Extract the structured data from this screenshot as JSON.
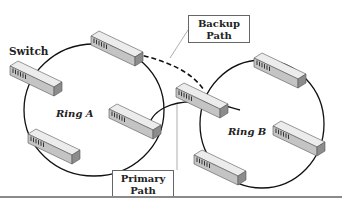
{
  "diagram": {
    "labels": {
      "switch": "Switch",
      "ring_a": "Ring A",
      "ring_b": "Ring B"
    },
    "callouts": {
      "backup": {
        "line1": "Backup",
        "line2": "Path"
      },
      "primary": {
        "line1": "Primary",
        "line2": "Path"
      }
    },
    "rings": [
      {
        "name": "Ring A",
        "switch_count": 4
      },
      {
        "name": "Ring B",
        "switch_count": 4
      }
    ],
    "links": [
      {
        "type": "primary",
        "style": "solid",
        "from": "Ring A",
        "to": "Ring B"
      },
      {
        "type": "backup",
        "style": "dashed",
        "from": "Ring A",
        "to": "Ring B"
      }
    ],
    "colors": {
      "line": "#111111",
      "switch_top": "#e6e6e6",
      "switch_front": "#bdbdbd",
      "switch_side": "#8f8f8f",
      "callout_border": "#666666"
    }
  }
}
